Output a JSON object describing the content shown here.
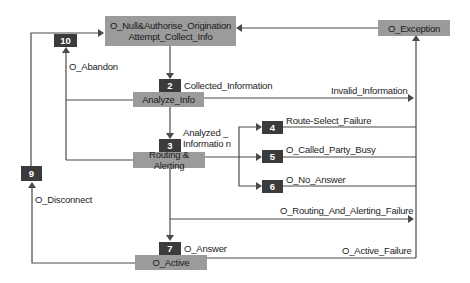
{
  "states": {
    "s1": {
      "line1": "O_Null&Authorise_Origination",
      "line2": "Attempt_Collect_Info"
    },
    "s2": "Analyze_Info",
    "s3": "Routing & Alerting",
    "s7": "O_Active",
    "exception": "O_Exception"
  },
  "points_in_call": {
    "p2": "2",
    "p3": "3",
    "p4": "4",
    "p5": "5",
    "p6": "6",
    "p7": "7",
    "p9": "9",
    "p10": "10"
  },
  "events": {
    "collected_information": "Collected_Information",
    "invalid_information": "Invalid_Information",
    "analyzed_information_1": "Analyzed _",
    "analyzed_information_2": "Informatio n",
    "route_select_failure": "Route-Select_Failure",
    "o_called_party_busy": "O_Called_Party_Busy",
    "o_no_answer": "O_No_Answer",
    "o_routing_and_alerting_failure": "O_Routing_And_Alerting_Failure",
    "o_answer": "O_Answer",
    "o_active_failure": "O_Active_Failure",
    "o_abandon": "O_Abandon",
    "o_disconnect": "O_Disconnect"
  },
  "colors": {
    "state_fill": "#9b9b9b",
    "badge_fill": "#3b3b3b",
    "line": "#4a4a4a"
  }
}
